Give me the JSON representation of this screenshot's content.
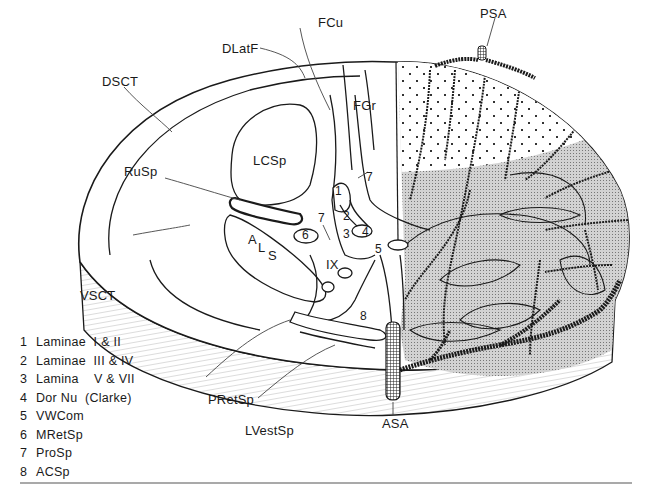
{
  "figure": {
    "labels": {
      "fcu": "FCu",
      "dlatf": "DLatF",
      "psa": "PSA",
      "dsct": "DSCT",
      "fgr": "FGr",
      "lcsp": "LCSp",
      "rusp": "RuSp",
      "als_a": "A",
      "als_l": "L",
      "als_s": "S",
      "vsct": "VSCT",
      "ix": "IX",
      "pretsp": "PRetSp",
      "lvestsp": "LVestSp",
      "asa": "ASA",
      "num_1": "1",
      "num_2": "2",
      "num_3": "3",
      "num_4": "4",
      "num_5": "5",
      "num_6": "6",
      "num_7a": "7",
      "num_7b": "7",
      "num_8": "8"
    }
  },
  "legend": [
    {
      "num": "1",
      "label": "Laminae  I & II"
    },
    {
      "num": "2",
      "label": "Laminae  III & IV"
    },
    {
      "num": "3",
      "label": "Lamina    V & VII"
    },
    {
      "num": "4",
      "label": "Dor Nu  (Clarke)"
    },
    {
      "num": "5",
      "label": "VWCom"
    },
    {
      "num": "6",
      "label": "MRetSp"
    },
    {
      "num": "7",
      "label": "ProSp"
    },
    {
      "num": "8",
      "label": "ACSp"
    }
  ],
  "colors": {
    "ink": "#1a1a1a",
    "shade": "#bdbdbd",
    "rule": "#a9a9a9"
  }
}
